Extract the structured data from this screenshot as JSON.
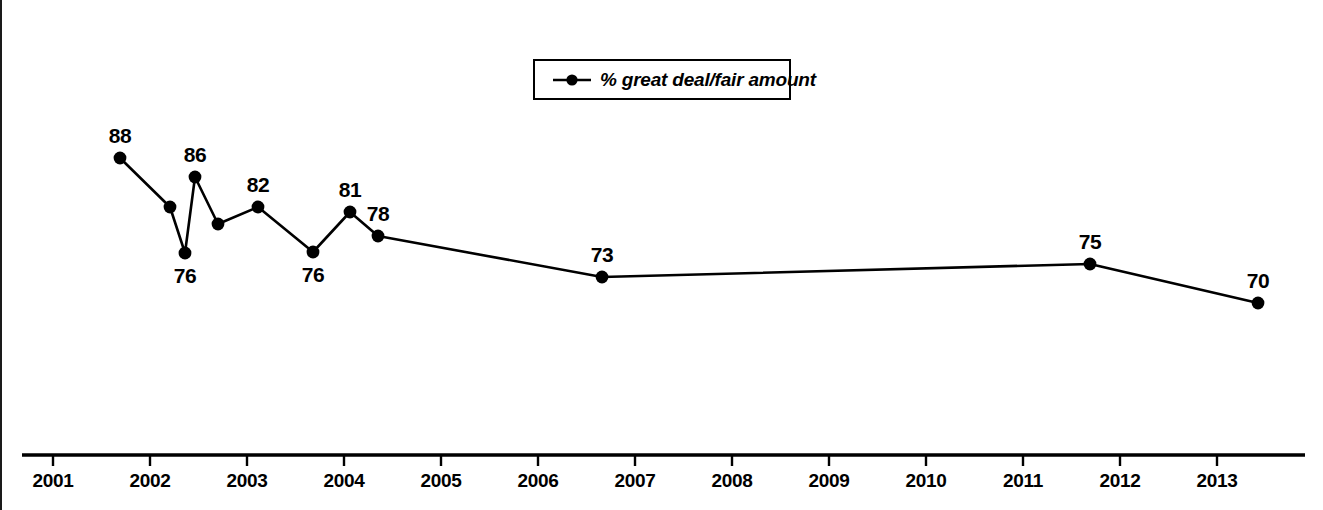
{
  "legend": {
    "series_label": "% great deal/fair amount",
    "marker_icon": "line-dot-marker-icon",
    "position": "top-center"
  },
  "axis": {
    "tick_labels": [
      "2001",
      "2002",
      "2003",
      "2004",
      "2005",
      "2006",
      "2007",
      "2008",
      "2009",
      "2010",
      "2011",
      "2012",
      "2013"
    ]
  },
  "colors": {
    "line": "#000000",
    "marker": "#000000",
    "text": "#000000",
    "background": "#ffffff"
  },
  "chart_data": {
    "type": "line",
    "title": "",
    "subtitle": "",
    "xlabel": "",
    "ylabel": "",
    "grid": false,
    "legend_position": "top-center",
    "axis_style": "x-axis-only",
    "xlim": [
      2001,
      2013
    ],
    "ylim": [
      60,
      95
    ],
    "series": [
      {
        "name": "% great deal/fair amount",
        "points": [
          {
            "x": 2001.7,
            "y": 88,
            "label": "88",
            "label_position": "above",
            "px": 120,
            "py": 158
          },
          {
            "x": 2002.2,
            "y": 82,
            "label": "",
            "label_position": "none",
            "px": 170,
            "py": 207
          },
          {
            "x": 2002.35,
            "y": 76,
            "label": "76",
            "label_position": "below",
            "px": 185,
            "py": 253
          },
          {
            "x": 2002.45,
            "y": 86,
            "label": "86",
            "label_position": "above",
            "px": 195,
            "py": 177
          },
          {
            "x": 2002.7,
            "y": 79,
            "label": "",
            "label_position": "none",
            "px": 218,
            "py": 224
          },
          {
            "x": 2003.1,
            "y": 82,
            "label": "82",
            "label_position": "above",
            "px": 258,
            "py": 207
          },
          {
            "x": 2003.65,
            "y": 76,
            "label": "76",
            "label_position": "below",
            "px": 313,
            "py": 252
          },
          {
            "x": 2004.05,
            "y": 81,
            "label": "81",
            "label_position": "above",
            "px": 350,
            "py": 212
          },
          {
            "x": 2004.3,
            "y": 78,
            "label": "78",
            "label_position": "above",
            "px": 378,
            "py": 236
          },
          {
            "x": 2006.65,
            "y": 73,
            "label": "73",
            "label_position": "above",
            "px": 602,
            "py": 277
          },
          {
            "x": 2011.6,
            "y": 75,
            "label": "75",
            "label_position": "above",
            "px": 1090,
            "py": 264
          },
          {
            "x": 2013.3,
            "y": 70,
            "label": "70",
            "label_position": "above",
            "px": 1258,
            "py": 303
          }
        ]
      }
    ]
  }
}
